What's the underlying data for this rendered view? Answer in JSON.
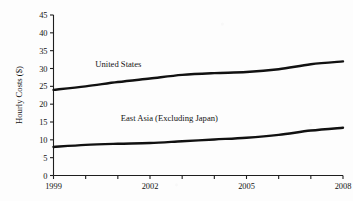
{
  "chart_data": {
    "type": "line",
    "title": "",
    "xlabel": "",
    "ylabel": "Hourly Costs ($)",
    "xlim": [
      1999,
      2008
    ],
    "ylim": [
      0,
      45
    ],
    "grid": false,
    "legend_position": "inline-annotations",
    "x": [
      1999,
      2000,
      2001,
      2002,
      2003,
      2004,
      2005,
      2006,
      2007,
      2008
    ],
    "xticks_major": [
      "1999",
      "2002",
      "2005",
      "2008"
    ],
    "yticks": [
      "0",
      "5",
      "10",
      "15",
      "20",
      "25",
      "30",
      "35",
      "40",
      "45"
    ],
    "series": [
      {
        "name": "United States",
        "values": [
          24.0,
          25.0,
          26.2,
          27.2,
          28.2,
          28.7,
          29.0,
          29.8,
          31.2,
          32.0
        ],
        "color": "#111111",
        "label_x": 2000.3,
        "label_y": 30.5
      },
      {
        "name": "East Asia (Excluding Japan)",
        "values": [
          8.0,
          8.6,
          8.9,
          9.1,
          9.6,
          10.1,
          10.6,
          11.4,
          12.6,
          13.4
        ],
        "color": "#111111",
        "label_x": 2002.6,
        "label_y": 15.4
      }
    ]
  },
  "figure": {
    "ylabel": "Hourly Costs ($)",
    "series_labels": {
      "us": "United States",
      "east_asia": "East Asia (Excluding Japan)"
    }
  }
}
